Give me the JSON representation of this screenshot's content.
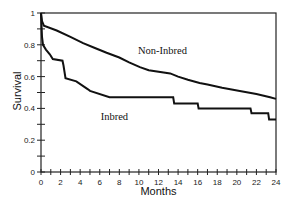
{
  "chart_data": {
    "type": "line",
    "subtype": "kaplan-meier-step",
    "title": "",
    "xlabel": "Months",
    "ylabel": "Survival",
    "xlim": [
      0,
      24
    ],
    "ylim": [
      0,
      1
    ],
    "x_ticks": [
      0,
      2,
      4,
      6,
      8,
      10,
      12,
      14,
      16,
      18,
      20,
      22,
      24
    ],
    "x_minor_step": 1,
    "y_ticks": [
      0,
      0.2,
      0.4,
      0.6,
      0.8,
      1
    ],
    "y_tick_labels": [
      "0",
      "0.2",
      "0.4",
      "0.6",
      "0.8",
      "1"
    ],
    "y_minor_step": 0.1,
    "grid": false,
    "legend": "inline-labels",
    "series": [
      {
        "name": "Non-Inbred",
        "label_pos": [
          9.9,
          0.74
        ],
        "points": [
          [
            0,
            1
          ],
          [
            0.1,
            0.95
          ],
          [
            0.3,
            0.92
          ],
          [
            1.6,
            0.89
          ],
          [
            3,
            0.85
          ],
          [
            4.3,
            0.81
          ],
          [
            5.5,
            0.78
          ],
          [
            6.7,
            0.75
          ],
          [
            8,
            0.72
          ],
          [
            9,
            0.69
          ],
          [
            10.1,
            0.66
          ],
          [
            11,
            0.64
          ],
          [
            13.2,
            0.62
          ],
          [
            14,
            0.6
          ],
          [
            15,
            0.58
          ],
          [
            16.2,
            0.56
          ],
          [
            17,
            0.55
          ],
          [
            18.5,
            0.53
          ],
          [
            20.3,
            0.51
          ],
          [
            22,
            0.49
          ],
          [
            23.4,
            0.47
          ],
          [
            24,
            0.46
          ]
        ]
      },
      {
        "name": "Inbred",
        "label_pos": [
          6.1,
          0.33
        ],
        "points": [
          [
            0,
            1
          ],
          [
            0.1,
            0.85
          ],
          [
            0.2,
            0.8
          ],
          [
            0.5,
            0.77
          ],
          [
            0.9,
            0.74
          ],
          [
            1.2,
            0.71
          ],
          [
            2.2,
            0.7
          ],
          [
            2.3,
            0.67
          ],
          [
            2.5,
            0.59
          ],
          [
            3.6,
            0.57
          ],
          [
            4.8,
            0.52
          ],
          [
            5,
            0.51
          ],
          [
            7,
            0.47
          ],
          [
            13.5,
            0.47
          ],
          [
            13.6,
            0.43
          ],
          [
            16,
            0.43
          ],
          [
            16.1,
            0.4
          ],
          [
            21.4,
            0.4
          ],
          [
            21.5,
            0.37
          ],
          [
            23.2,
            0.37
          ],
          [
            23.3,
            0.33
          ],
          [
            24,
            0.33
          ]
        ]
      }
    ]
  },
  "colors": {
    "line": "#111111",
    "axis": "#222222",
    "background": "#ffffff"
  }
}
